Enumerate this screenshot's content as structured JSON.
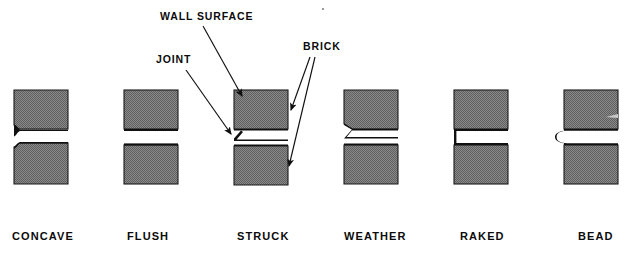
{
  "figure": {
    "background_color": "#ffffff",
    "brick_fill_color": "#7d7d7d",
    "brick_outline_color": "#1a1a1a",
    "ink_color": "#0b0b0b"
  },
  "callouts": [
    {
      "id": "wall-surface",
      "label": "WALL  SURFACE",
      "x": 160,
      "y": 20
    },
    {
      "id": "joint",
      "label": "JOINT",
      "x": 156,
      "y": 63
    },
    {
      "id": "brick",
      "label": "BRICK",
      "x": 303,
      "y": 50
    }
  ],
  "joints": [
    {
      "id": "concave",
      "label": "CONCAVE",
      "profile": "curved recess, quarter-round tooled inward",
      "label_x": 12,
      "label_y": 240,
      "brick_x": 14,
      "brick_top_y": 90,
      "brick_width": 54,
      "brick_height": 40,
      "joint_y": 130,
      "joint_height": 12
    },
    {
      "id": "flush",
      "label": "FLUSH",
      "profile": "flat, level with wall surface",
      "label_x": 127,
      "label_y": 240,
      "brick_x": 124,
      "brick_top_y": 90,
      "brick_width": 54,
      "brick_height": 40,
      "joint_y": 130,
      "joint_height": 12
    },
    {
      "id": "struck",
      "label": "STRUCK",
      "profile": "angled inward from top, sloping back downward",
      "label_x": 237,
      "label_y": 240,
      "brick_x": 234,
      "brick_top_y": 90,
      "brick_width": 54,
      "brick_height": 40,
      "joint_y": 130,
      "joint_height": 12
    },
    {
      "id": "weather",
      "label": "WEATHER",
      "profile": "angled outward, sloping down and out to shed water",
      "label_x": 344,
      "label_y": 240,
      "brick_x": 344,
      "brick_top_y": 90,
      "brick_width": 54,
      "brick_height": 40,
      "joint_y": 130,
      "joint_height": 12
    },
    {
      "id": "raked",
      "label": "RAKED",
      "profile": "square joint raked deeply back from wall surface",
      "label_x": 460,
      "label_y": 240,
      "brick_x": 454,
      "brick_top_y": 90,
      "brick_width": 54,
      "brick_height": 40,
      "joint_y": 130,
      "joint_height": 12
    },
    {
      "id": "bead",
      "label": "BEAD",
      "profile": "rounded bead protruding beyond wall surface",
      "label_x": 578,
      "label_y": 240,
      "brick_x": 564,
      "brick_top_y": 90,
      "brick_width": 54,
      "brick_height": 40,
      "joint_y": 130,
      "joint_height": 12
    }
  ]
}
